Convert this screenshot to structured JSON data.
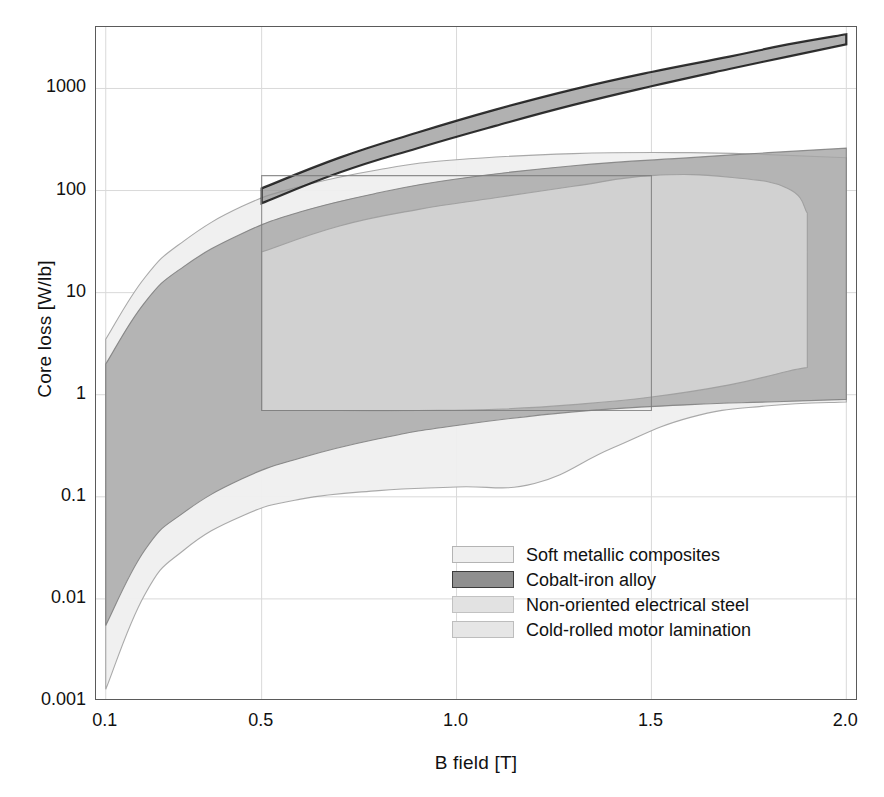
{
  "chart_data": {
    "type": "area",
    "title": "",
    "xlabel": "B field [T]",
    "ylabel": "Core loss [W/lb]",
    "xscale": "linear",
    "yscale": "log",
    "xlim": [
      0.075,
      2.03
    ],
    "ylim": [
      0.001,
      4000
    ],
    "xticks": [
      "0.1",
      "0.5",
      "1.0",
      "1.5",
      "2.0"
    ],
    "xtick_values": [
      0.1,
      0.5,
      1.0,
      1.5,
      2.0
    ],
    "yticks": [
      "0.001",
      "0.01",
      "0.1",
      "1",
      "10",
      "100",
      "1000"
    ],
    "ytick_values": [
      0.001,
      0.01,
      0.1,
      1,
      10,
      100,
      1000
    ],
    "grid": true,
    "grid_color": "#d9d9d9",
    "legend_position": "lower-right-inside",
    "series": [
      {
        "name": "Soft metallic composites",
        "fill": "#efefef",
        "stroke": "#9b9b9b",
        "upper": [
          {
            "x": 0.1,
            "y": 3.5
          },
          {
            "x": 0.2,
            "y": 14
          },
          {
            "x": 0.3,
            "y": 32
          },
          {
            "x": 0.45,
            "y": 70
          },
          {
            "x": 0.6,
            "y": 110
          },
          {
            "x": 0.8,
            "y": 160
          },
          {
            "x": 1.0,
            "y": 200
          },
          {
            "x": 1.3,
            "y": 230
          },
          {
            "x": 1.6,
            "y": 235
          },
          {
            "x": 1.8,
            "y": 225
          },
          {
            "x": 2.0,
            "y": 210
          }
        ],
        "lower": [
          {
            "x": 0.1,
            "y": 0.0013
          },
          {
            "x": 0.2,
            "y": 0.011
          },
          {
            "x": 0.3,
            "y": 0.03
          },
          {
            "x": 0.45,
            "y": 0.065
          },
          {
            "x": 0.6,
            "y": 0.095
          },
          {
            "x": 0.8,
            "y": 0.115
          },
          {
            "x": 1.0,
            "y": 0.125
          },
          {
            "x": 1.2,
            "y": 0.135
          },
          {
            "x": 1.4,
            "y": 0.3
          },
          {
            "x": 1.6,
            "y": 0.6
          },
          {
            "x": 1.8,
            "y": 0.78
          },
          {
            "x": 2.0,
            "y": 0.85
          }
        ]
      },
      {
        "name": "Cobalt-iron alloy",
        "fill": "#939393",
        "stroke": "#111111",
        "upper": [
          {
            "x": 0.5,
            "y": 105
          },
          {
            "x": 0.7,
            "y": 210
          },
          {
            "x": 0.9,
            "y": 370
          },
          {
            "x": 1.1,
            "y": 620
          },
          {
            "x": 1.3,
            "y": 980
          },
          {
            "x": 1.5,
            "y": 1450
          },
          {
            "x": 1.7,
            "y": 2050
          },
          {
            "x": 1.85,
            "y": 2700
          },
          {
            "x": 2.0,
            "y": 3400
          }
        ],
        "lower": [
          {
            "x": 0.5,
            "y": 75
          },
          {
            "x": 0.7,
            "y": 150
          },
          {
            "x": 0.9,
            "y": 260
          },
          {
            "x": 1.1,
            "y": 430
          },
          {
            "x": 1.3,
            "y": 690
          },
          {
            "x": 1.5,
            "y": 1050
          },
          {
            "x": 1.7,
            "y": 1550
          },
          {
            "x": 1.85,
            "y": 2050
          },
          {
            "x": 2.0,
            "y": 2700
          }
        ]
      },
      {
        "name": "Non-oriented electrical steel",
        "fill": "#a5a5a5",
        "stroke": "#7d7d7d",
        "upper": [
          {
            "x": 0.1,
            "y": 2.0
          },
          {
            "x": 0.2,
            "y": 8.0
          },
          {
            "x": 0.3,
            "y": 18
          },
          {
            "x": 0.45,
            "y": 38
          },
          {
            "x": 0.6,
            "y": 62
          },
          {
            "x": 0.8,
            "y": 95
          },
          {
            "x": 1.0,
            "y": 130
          },
          {
            "x": 1.3,
            "y": 175
          },
          {
            "x": 1.6,
            "y": 210
          },
          {
            "x": 1.8,
            "y": 235
          },
          {
            "x": 2.0,
            "y": 260
          }
        ],
        "lower": [
          {
            "x": 0.1,
            "y": 0.0055
          },
          {
            "x": 0.2,
            "y": 0.03
          },
          {
            "x": 0.3,
            "y": 0.07
          },
          {
            "x": 0.45,
            "y": 0.15
          },
          {
            "x": 0.6,
            "y": 0.24
          },
          {
            "x": 0.8,
            "y": 0.37
          },
          {
            "x": 1.0,
            "y": 0.5
          },
          {
            "x": 1.3,
            "y": 0.68
          },
          {
            "x": 1.6,
            "y": 0.8
          },
          {
            "x": 1.8,
            "y": 0.85
          },
          {
            "x": 2.0,
            "y": 0.9
          }
        ]
      },
      {
        "name": "Cold-rolled motor lamination",
        "fill": "#dcdcdc",
        "stroke": "#9b9b9b",
        "upper": [
          {
            "x": 0.5,
            "y": 25
          },
          {
            "x": 0.7,
            "y": 45
          },
          {
            "x": 0.9,
            "y": 65
          },
          {
            "x": 1.1,
            "y": 85
          },
          {
            "x": 1.3,
            "y": 110
          },
          {
            "x": 1.5,
            "y": 140
          },
          {
            "x": 1.7,
            "y": 135
          },
          {
            "x": 1.85,
            "y": 105
          },
          {
            "x": 1.9,
            "y": 60
          }
        ],
        "lower": [
          {
            "x": 0.5,
            "y": 0.7
          },
          {
            "x": 0.7,
            "y": 0.7
          },
          {
            "x": 0.9,
            "y": 0.7
          },
          {
            "x": 1.1,
            "y": 0.72
          },
          {
            "x": 1.3,
            "y": 0.8
          },
          {
            "x": 1.5,
            "y": 0.95
          },
          {
            "x": 1.7,
            "y": 1.25
          },
          {
            "x": 1.85,
            "y": 1.7
          },
          {
            "x": 1.9,
            "y": 1.85
          }
        ]
      }
    ],
    "inner_outline_1": {
      "name": "soft-composite-inner-box",
      "points": [
        {
          "x": 0.5,
          "y": 0.7
        },
        {
          "x": 1.5,
          "y": 0.7
        },
        {
          "x": 1.5,
          "y": 140
        },
        {
          "x": 0.5,
          "y": 140
        }
      ]
    }
  },
  "axes": {
    "ylabel": "Core loss [W/lb]",
    "xlabel": "B field [T]",
    "yticks": [
      {
        "label": "1000",
        "value": 1000
      },
      {
        "label": "100",
        "value": 100
      },
      {
        "label": "10",
        "value": 10
      },
      {
        "label": "1",
        "value": 1
      },
      {
        "label": "0.1",
        "value": 0.1
      },
      {
        "label": "0.01",
        "value": 0.01
      },
      {
        "label": "0.001",
        "value": 0.001
      }
    ],
    "xticks": [
      {
        "label": "0.1",
        "value": 0.1
      },
      {
        "label": "0.5",
        "value": 0.5
      },
      {
        "label": "1.0",
        "value": 1.0
      },
      {
        "label": "1.5",
        "value": 1.5
      },
      {
        "label": "2.0",
        "value": 2.0
      }
    ]
  },
  "legend": {
    "items": [
      {
        "label": "Soft metallic composites",
        "fill": "#efefef",
        "stroke": "#b4b4b4"
      },
      {
        "label": "Cobalt-iron alloy",
        "fill": "#8f8f8f",
        "stroke": "#3c3c3c"
      },
      {
        "label": "Non-oriented electrical steel",
        "fill": "#e2e2e2",
        "stroke": "#c2c2c2"
      },
      {
        "label": "Cold-rolled motor lamination",
        "fill": "#e6e6e6",
        "stroke": "#bdbdbd"
      }
    ]
  }
}
